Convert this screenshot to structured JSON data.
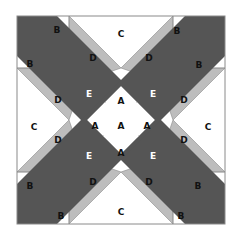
{
  "diagram": {
    "type": "quilt-block",
    "colors": {
      "background": "#ffffff",
      "outline": "#8a8a8a",
      "piece_white": "#ffffff",
      "piece_light_gray": "#bdbdbd",
      "piece_dark_gray": "#555555",
      "label_dark": "#111111",
      "label_light": "#ffffff"
    },
    "labels": {
      "B": "B",
      "C": "C",
      "D": "D",
      "E": "E",
      "A": "A"
    },
    "pieces": {
      "B": {
        "count": 8,
        "fill": "white"
      },
      "C": {
        "count": 4,
        "fill": "white"
      },
      "D": {
        "count": 8,
        "fill": "light gray"
      },
      "E": {
        "count": 4,
        "fill": "dark gray"
      },
      "A": {
        "count": 5,
        "fill": "white"
      }
    }
  }
}
